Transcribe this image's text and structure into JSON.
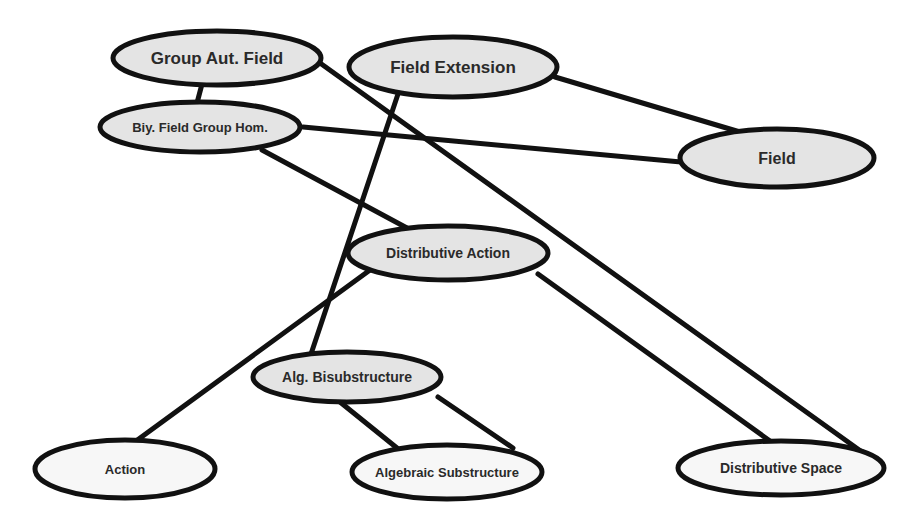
{
  "diagram": {
    "type": "concept-graph",
    "colors": {
      "stroke": "#111111",
      "fill_shaded": "#e4e4e4",
      "fill_light": "#f7f7f7",
      "text": "#2a2a2a",
      "background": "#ffffff"
    },
    "nodes": [
      {
        "id": "group_aut_field",
        "label": "Group Aut. Field",
        "cx": 217,
        "cy": 58,
        "rx": 104,
        "ry": 27,
        "fill": "shaded",
        "font_size": 17
      },
      {
        "id": "field_extension",
        "label": "Field Extension",
        "cx": 453,
        "cy": 67,
        "rx": 104,
        "ry": 30,
        "fill": "shaded",
        "font_size": 17
      },
      {
        "id": "biy_field_group_hom",
        "label": "Biy. Field Group Hom.",
        "cx": 200,
        "cy": 127,
        "rx": 100,
        "ry": 25,
        "fill": "shaded",
        "font_size": 13
      },
      {
        "id": "field",
        "label": "Field",
        "cx": 777,
        "cy": 158,
        "rx": 97,
        "ry": 29,
        "fill": "shaded",
        "font_size": 16
      },
      {
        "id": "distributive_action",
        "label": "Distributive Action",
        "cx": 448,
        "cy": 253,
        "rx": 100,
        "ry": 27,
        "fill": "shaded",
        "font_size": 14
      },
      {
        "id": "alg_bisubstructure",
        "label": "Alg. Bisubstructure",
        "cx": 347,
        "cy": 377,
        "rx": 94,
        "ry": 25,
        "fill": "shaded",
        "font_size": 14
      },
      {
        "id": "action",
        "label": "Action",
        "cx": 125,
        "cy": 469,
        "rx": 90,
        "ry": 29,
        "fill": "light",
        "font_size": 13
      },
      {
        "id": "algebraic_substructure",
        "label": "Algebraic Substructure",
        "cx": 447,
        "cy": 472,
        "rx": 95,
        "ry": 27,
        "fill": "light",
        "font_size": 13
      },
      {
        "id": "distributive_space",
        "label": "Distributive Space",
        "cx": 781,
        "cy": 468,
        "rx": 103,
        "ry": 27,
        "fill": "light",
        "font_size": 14
      }
    ],
    "edges": [
      {
        "from": "group_aut_field",
        "to": "biy_field_group_hom",
        "x1": 202,
        "y1": 84,
        "x2": 197,
        "y2": 103
      },
      {
        "from": "group_aut_field",
        "to": "distributive_space",
        "x1": 320,
        "y1": 63,
        "x2": 862,
        "y2": 452
      },
      {
        "from": "field_extension",
        "to": "field",
        "x1": 555,
        "y1": 77,
        "x2": 740,
        "y2": 132
      },
      {
        "from": "field_extension",
        "to": "alg_bisubstructure",
        "x1": 399,
        "y1": 91,
        "x2": 311,
        "y2": 354
      },
      {
        "from": "biy_field_group_hom",
        "to": "field",
        "x1": 303,
        "y1": 127,
        "x2": 681,
        "y2": 162
      },
      {
        "from": "biy_field_group_hom",
        "to": "distributive_action",
        "x1": 262,
        "y1": 150,
        "x2": 407,
        "y2": 228
      },
      {
        "from": "distributive_action",
        "to": "action",
        "x1": 370,
        "y1": 270,
        "x2": 136,
        "y2": 441
      },
      {
        "from": "distributive_action",
        "to": "distributive_space",
        "x1": 538,
        "y1": 274,
        "x2": 770,
        "y2": 441
      },
      {
        "from": "alg_bisubstructure",
        "to": "algebraic_substructure",
        "x1": 340,
        "y1": 402,
        "x2": 397,
        "y2": 448
      },
      {
        "from": "alg_bisubstructure",
        "to": "algebraic_substructure",
        "x1": 438,
        "y1": 397,
        "x2": 513,
        "y2": 448
      }
    ]
  }
}
